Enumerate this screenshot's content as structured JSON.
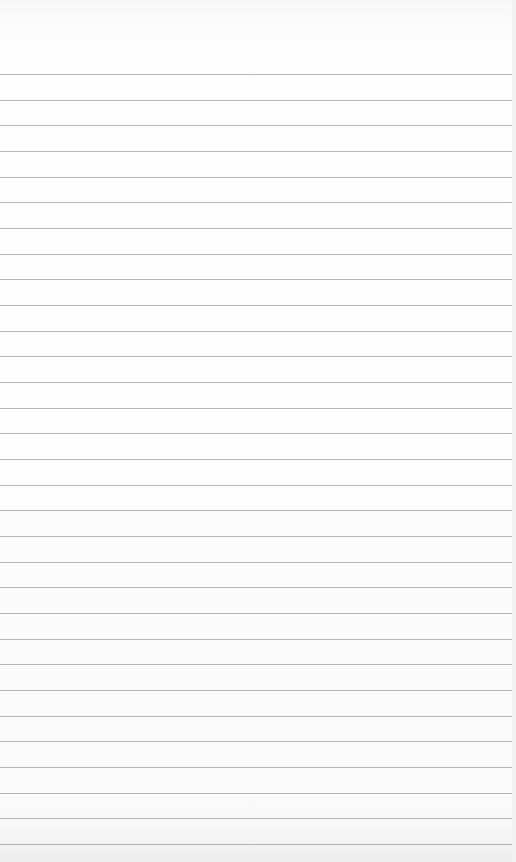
{
  "paper": {
    "type": "lined-paper",
    "line_count": 31,
    "first_line_y": 74,
    "line_spacing": 25.67,
    "line_color": "#a9a9a9",
    "background_color": "#fdfdfd"
  }
}
